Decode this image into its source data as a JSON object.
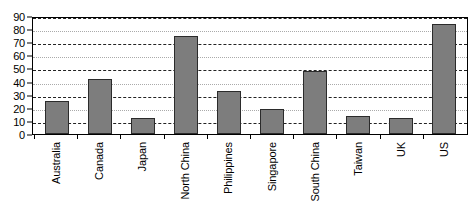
{
  "chart_data": {
    "type": "bar",
    "title": "",
    "subtitle": "",
    "xlabel": "",
    "ylabel": "",
    "ylim": [
      0,
      90
    ],
    "yticks": [
      0,
      10,
      20,
      30,
      40,
      50,
      60,
      70,
      80,
      90
    ],
    "grid": true,
    "legend": false,
    "legend_position": "none",
    "categories": [
      "Australia",
      "Canada",
      "Japan",
      "North China",
      "Philippines",
      "Singapore",
      "South China",
      "Taiwan",
      "UK",
      "US"
    ],
    "values": [
      25,
      42,
      12,
      75,
      33,
      19,
      48,
      14,
      12,
      84
    ],
    "bar_color": "#7d7d7d",
    "bar_edge_color": "#2b2b2b",
    "gridline_color": "#555555",
    "axis_color": "#000000",
    "background_color": "#ffffff"
  }
}
